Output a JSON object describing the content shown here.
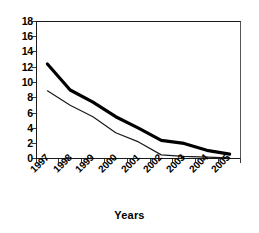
{
  "chart_data": {
    "type": "line",
    "title": "",
    "xlabel": "Years",
    "ylabel": "",
    "categories": [
      "1997",
      "1998",
      "1999",
      "2000",
      "2001",
      "2002",
      "2003",
      "2004",
      "2005"
    ],
    "ylim": [
      0,
      18
    ],
    "ytick_labels": [
      "18",
      "16",
      "14",
      "12",
      "10",
      "8",
      "6",
      "4",
      "2",
      "0"
    ],
    "ytick_values": [
      18,
      16,
      14,
      12,
      10,
      8,
      6,
      4,
      2,
      0
    ],
    "ytick_step": 2,
    "grid": true,
    "grid_axis": "y",
    "legend": "none",
    "series": [
      {
        "name": "thick-series",
        "style": "thick-black-line",
        "color": "#000000",
        "width": 3.2,
        "values": [
          12.4,
          9.0,
          7.4,
          5.5,
          4.0,
          2.4,
          2.0,
          1.1,
          0.6
        ]
      },
      {
        "name": "thin-series",
        "style": "thin-black-line",
        "color": "#1a1a1a",
        "width": 1.2,
        "values": [
          8.9,
          7.0,
          5.5,
          3.4,
          2.2,
          0.5,
          0.3,
          0.2,
          0.1
        ]
      }
    ]
  },
  "axis": {
    "x_title": "Years"
  }
}
